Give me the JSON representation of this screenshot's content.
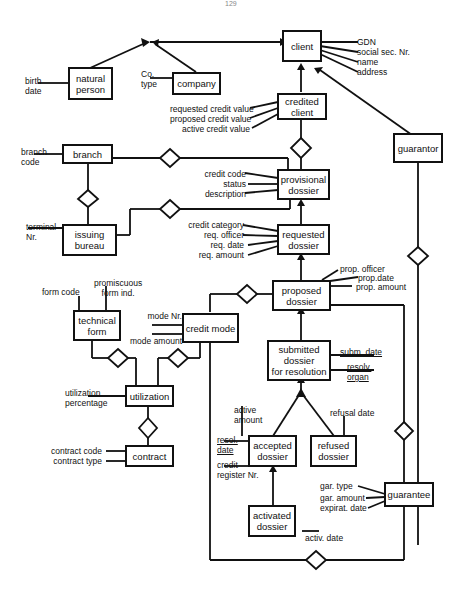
{
  "page": {
    "number": "129"
  },
  "entities": {
    "client": "client",
    "natural_person": "natural\nperson",
    "company": "company",
    "credited_client": "credited\nclient",
    "guarantor": "guarantor",
    "branch": "branch",
    "provisional_dossier": "provisional\ndossier",
    "issuing_bureau": "issuing\nbureau",
    "requested_dossier": "requested\ndossier",
    "proposed_dossier": "proposed\ndossier",
    "technical_form": "technical\nform",
    "credit_mode": "credit mode",
    "submitted_dossier": "submitted\ndossier\nfor resolution",
    "utilization": "utilization",
    "accepted_dossier": "accepted\ndossier",
    "refused_dossier": "refused\ndossier",
    "contract": "contract",
    "guarantee": "guarantee",
    "activated_dossier": "activated\ndossier"
  },
  "attributes": {
    "client": [
      "GDN",
      "social sec. Nr.",
      "name",
      "address"
    ],
    "natural_person": [
      "birth\ndate"
    ],
    "company": [
      "Co.\ntype"
    ],
    "credited_client": [
      "requested credit value",
      "proposed credit value",
      "active credit value"
    ],
    "branch": [
      "branch\ncode"
    ],
    "provisional_dossier": [
      "credit code",
      "status",
      "description"
    ],
    "issuing_bureau": [
      "terminal\nNr."
    ],
    "requested_dossier": [
      "credit category",
      "req. officer",
      "req. date",
      "req. amount"
    ],
    "proposed_dossier": [
      "prop. officer",
      "prop.date",
      "prop. amount"
    ],
    "technical_form": [
      "form code",
      "promiscuous\nform ind."
    ],
    "credit_mode": [
      "mode Nr.",
      "mode amount"
    ],
    "submitted_dossier": [
      "subm. date",
      "resolv.\norgan"
    ],
    "utilization": [
      "utilization\npercentage"
    ],
    "accepted_dossier": [
      "active\namount",
      "resol.\ndate",
      "credit\nregister Nr."
    ],
    "refused_dossier": [
      "refusal date"
    ],
    "contract": [
      "contract code",
      "contract type"
    ],
    "guarantee": [
      "gar. type",
      "gar. amount",
      "expirat. date"
    ],
    "activated_dossier": [
      "activ. date"
    ]
  }
}
